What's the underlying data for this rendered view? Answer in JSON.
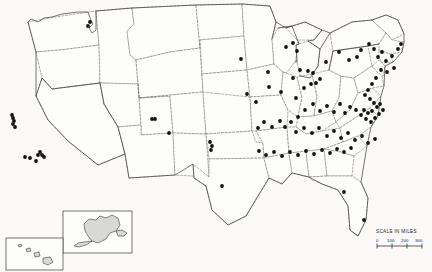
{
  "map": {
    "title": "United States dot distribution map",
    "projection_note": "contiguous United States with Alaska and Hawaii insets",
    "background_color": "#fbfaf8",
    "land_fill": "#fdfdfb",
    "coast_stroke": "#3a3a3a",
    "state_border_stroke": "#6e6e6e",
    "dot_color": "#121212",
    "dot_radius": 1.9,
    "state_borders_style": "dashed"
  },
  "scale": {
    "label": "SCALE IN MILES",
    "ticks": [
      "0",
      "100",
      "200",
      "300"
    ],
    "tick_count": 4,
    "units": "miles"
  },
  "insets": [
    {
      "name": "alaska",
      "label": ""
    },
    {
      "name": "hawaii",
      "label": ""
    }
  ],
  "chart_data": {
    "type": "scatter",
    "xlabel": "",
    "ylabel": "",
    "points": [
      {
        "x": 88,
        "y": 26
      },
      {
        "x": 90,
        "y": 22
      },
      {
        "x": 12,
        "y": 115
      },
      {
        "x": 13,
        "y": 118
      },
      {
        "x": 14,
        "y": 121
      },
      {
        "x": 13,
        "y": 124
      },
      {
        "x": 15,
        "y": 127
      },
      {
        "x": 38,
        "y": 155
      },
      {
        "x": 40,
        "y": 152
      },
      {
        "x": 42,
        "y": 155
      },
      {
        "x": 44,
        "y": 157
      },
      {
        "x": 36,
        "y": 161
      },
      {
        "x": 30,
        "y": 158
      },
      {
        "x": 25,
        "y": 157
      },
      {
        "x": 155,
        "y": 119
      },
      {
        "x": 152,
        "y": 119
      },
      {
        "x": 210,
        "y": 142
      },
      {
        "x": 212,
        "y": 146
      },
      {
        "x": 211,
        "y": 150
      },
      {
        "x": 169,
        "y": 133
      },
      {
        "x": 222,
        "y": 186
      },
      {
        "x": 241,
        "y": 59
      },
      {
        "x": 247,
        "y": 94
      },
      {
        "x": 256,
        "y": 102
      },
      {
        "x": 269,
        "y": 87
      },
      {
        "x": 268,
        "y": 72
      },
      {
        "x": 286,
        "y": 47
      },
      {
        "x": 293,
        "y": 43
      },
      {
        "x": 297,
        "y": 51
      },
      {
        "x": 300,
        "y": 70
      },
      {
        "x": 293,
        "y": 78
      },
      {
        "x": 281,
        "y": 92
      },
      {
        "x": 296,
        "y": 98
      },
      {
        "x": 304,
        "y": 88
      },
      {
        "x": 311,
        "y": 84
      },
      {
        "x": 316,
        "y": 83
      },
      {
        "x": 320,
        "y": 79
      },
      {
        "x": 313,
        "y": 73
      },
      {
        "x": 308,
        "y": 71
      },
      {
        "x": 326,
        "y": 62
      },
      {
        "x": 339,
        "y": 52
      },
      {
        "x": 349,
        "y": 60
      },
      {
        "x": 357,
        "y": 57
      },
      {
        "x": 361,
        "y": 50
      },
      {
        "x": 369,
        "y": 44
      },
      {
        "x": 374,
        "y": 49
      },
      {
        "x": 378,
        "y": 57
      },
      {
        "x": 382,
        "y": 52
      },
      {
        "x": 386,
        "y": 61
      },
      {
        "x": 392,
        "y": 56
      },
      {
        "x": 398,
        "y": 49
      },
      {
        "x": 401,
        "y": 44
      },
      {
        "x": 394,
        "y": 68
      },
      {
        "x": 387,
        "y": 72
      },
      {
        "x": 381,
        "y": 70
      },
      {
        "x": 376,
        "y": 78
      },
      {
        "x": 372,
        "y": 84
      },
      {
        "x": 368,
        "y": 90
      },
      {
        "x": 365,
        "y": 95
      },
      {
        "x": 370,
        "y": 99
      },
      {
        "x": 374,
        "y": 103
      },
      {
        "x": 377,
        "y": 107
      },
      {
        "x": 372,
        "y": 111
      },
      {
        "x": 368,
        "y": 113
      },
      {
        "x": 364,
        "y": 110
      },
      {
        "x": 361,
        "y": 115
      },
      {
        "x": 366,
        "y": 119
      },
      {
        "x": 371,
        "y": 122
      },
      {
        "x": 375,
        "y": 118
      },
      {
        "x": 379,
        "y": 114
      },
      {
        "x": 383,
        "y": 110
      },
      {
        "x": 380,
        "y": 104
      },
      {
        "x": 356,
        "y": 110
      },
      {
        "x": 350,
        "y": 107
      },
      {
        "x": 345,
        "y": 113
      },
      {
        "x": 340,
        "y": 104
      },
      {
        "x": 334,
        "y": 112
      },
      {
        "x": 327,
        "y": 106
      },
      {
        "x": 320,
        "y": 111
      },
      {
        "x": 313,
        "y": 104
      },
      {
        "x": 305,
        "y": 110
      },
      {
        "x": 298,
        "y": 117
      },
      {
        "x": 291,
        "y": 122
      },
      {
        "x": 285,
        "y": 127
      },
      {
        "x": 296,
        "y": 132
      },
      {
        "x": 304,
        "y": 128
      },
      {
        "x": 312,
        "y": 133
      },
      {
        "x": 319,
        "y": 128
      },
      {
        "x": 327,
        "y": 136
      },
      {
        "x": 334,
        "y": 131
      },
      {
        "x": 341,
        "y": 138
      },
      {
        "x": 348,
        "y": 133
      },
      {
        "x": 355,
        "y": 140
      },
      {
        "x": 362,
        "y": 136
      },
      {
        "x": 368,
        "y": 143
      },
      {
        "x": 375,
        "y": 139
      },
      {
        "x": 351,
        "y": 148
      },
      {
        "x": 344,
        "y": 152
      },
      {
        "x": 337,
        "y": 149
      },
      {
        "x": 330,
        "y": 153
      },
      {
        "x": 322,
        "y": 150
      },
      {
        "x": 314,
        "y": 154
      },
      {
        "x": 306,
        "y": 151
      },
      {
        "x": 298,
        "y": 155
      },
      {
        "x": 290,
        "y": 152
      },
      {
        "x": 282,
        "y": 156
      },
      {
        "x": 274,
        "y": 152
      },
      {
        "x": 266,
        "y": 155
      },
      {
        "x": 259,
        "y": 151
      },
      {
        "x": 344,
        "y": 192
      },
      {
        "x": 364,
        "y": 220
      },
      {
        "x": 258,
        "y": 128
      },
      {
        "x": 264,
        "y": 122
      },
      {
        "x": 272,
        "y": 127
      },
      {
        "x": 280,
        "y": 121
      }
    ],
    "point_count": 115,
    "grid": false,
    "legend": "none"
  }
}
